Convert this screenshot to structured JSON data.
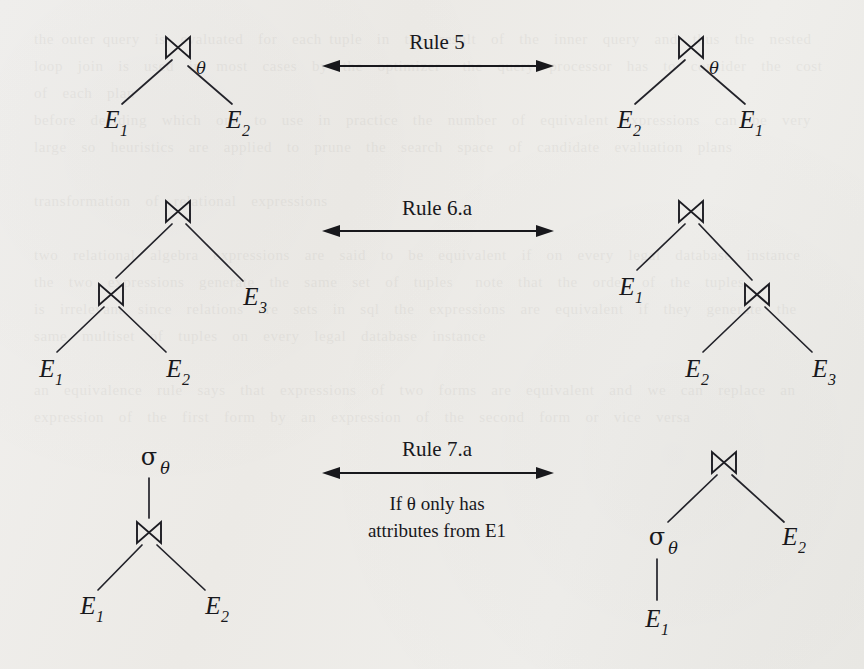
{
  "document": {
    "kind": "relational-algebra equivalence-rule diagram",
    "background_color": "#eeedea",
    "ink_color": "#18181c"
  },
  "glyphs": {
    "join": "⋈",
    "sigma": "σ",
    "theta": "θ",
    "arrow_double": "↔"
  },
  "rows": [
    {
      "id": "rule-5",
      "label": "Rule 5",
      "condition": "",
      "left_tree": {
        "root": {
          "symbol": "⋈",
          "subscript": "θ"
        },
        "leaves": [
          "E",
          "E"
        ],
        "leaf_subscripts": [
          "1",
          "2"
        ]
      },
      "right_tree": {
        "root": {
          "symbol": "⋈",
          "subscript": "θ"
        },
        "leaves": [
          "E",
          "E"
        ],
        "leaf_subscripts": [
          "2",
          "1"
        ]
      }
    },
    {
      "id": "rule-6a",
      "label": "Rule 6.a",
      "condition": "",
      "left_tree": {
        "root": {
          "symbol": "⋈",
          "subscript": ""
        },
        "inner": {
          "symbol": "⋈",
          "subscript": ""
        },
        "leaves": [
          "E",
          "E",
          "E"
        ],
        "leaf_subscripts": [
          "1",
          "2",
          "3"
        ]
      },
      "right_tree": {
        "root": {
          "symbol": "⋈",
          "subscript": ""
        },
        "inner": {
          "symbol": "⋈",
          "subscript": ""
        },
        "leaves": [
          "E",
          "E",
          "E"
        ],
        "leaf_subscripts": [
          "1",
          "2",
          "3"
        ]
      }
    },
    {
      "id": "rule-7a",
      "label": "Rule 7.a",
      "condition_line1": "If θ only has",
      "condition_line2": "attributes from E1",
      "left_tree": {
        "root": {
          "symbol": "σ",
          "subscript": "θ"
        },
        "inner": {
          "symbol": "⋈",
          "subscript": ""
        },
        "leaves": [
          "E",
          "E"
        ],
        "leaf_subscripts": [
          "1",
          "2"
        ]
      },
      "right_tree": {
        "root": {
          "symbol": "⋈",
          "subscript": ""
        },
        "inner": {
          "symbol": "σ",
          "subscript": "θ"
        },
        "leaves": [
          "E",
          "E"
        ],
        "leaf_subscripts": [
          "1",
          "2"
        ]
      }
    }
  ],
  "labels": {
    "E": "E",
    "sub1": "1",
    "sub2": "2",
    "sub3": "3"
  },
  "ghost_text": "the outer query  is  evaluated  for  each tuple  in  the  result  of  the  inner  query  and  thus  the  nested  loop  join  is  used  in  most  cases  by  the  optimizer   the  query  processor  has  to  consider  the  cost  of  each  plan\nbefore  deciding  which  one  to  use  in  practice  the  number  of  equivalent  expressions  can  be  very  large  so  heuristics  are  applied  to  prune  the  search  space  of  candidate  evaluation  plans\n\ntransformation  of  relational  expressions\n\ntwo  relational  algebra  expressions  are  said  to  be  equivalent  if  on  every  legal  database  instance  the  two  expressions  generate  the  same  set  of  tuples   note  that  the  order  of  the  tuples\nis  irrelevant  since  relations  are  sets  in  sql  the  expressions  are  equivalent  if  they  generate  the  same  multiset  of  tuples  on  every  legal  database  instance\n\nan  equivalence  rule  says  that  expressions  of  two  forms  are  equivalent  and  we  can  replace  an  expression  of  the  first  form  by  an  expression  of  the  second  form  or  vice  versa"
}
